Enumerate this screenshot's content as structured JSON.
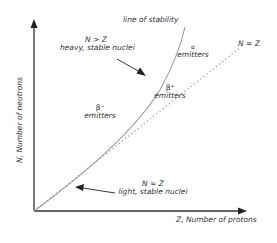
{
  "diagram": {
    "x_axis_label": "Z, Number of protons",
    "y_axis_label": "N, Number of neutrons",
    "curve_label": "line of stability",
    "diagonal_label": "N = Z",
    "annotations": {
      "heavy": {
        "relation": "N > Z",
        "text": "heavy, stable nuclei"
      },
      "light": {
        "relation": "N ≈ Z",
        "text": "light, stable nuclei"
      }
    },
    "regions": {
      "beta_minus": {
        "symbol": "β⁻",
        "text": "emitters"
      },
      "beta_plus": {
        "symbol": "β⁺",
        "text": "emitters"
      },
      "alpha": {
        "symbol": "α",
        "text": "emitters"
      }
    },
    "colors": {
      "axis": "#333333",
      "curve": "#9a9a9a",
      "diagonal": "#a8a8a8",
      "text": "#333333"
    }
  }
}
